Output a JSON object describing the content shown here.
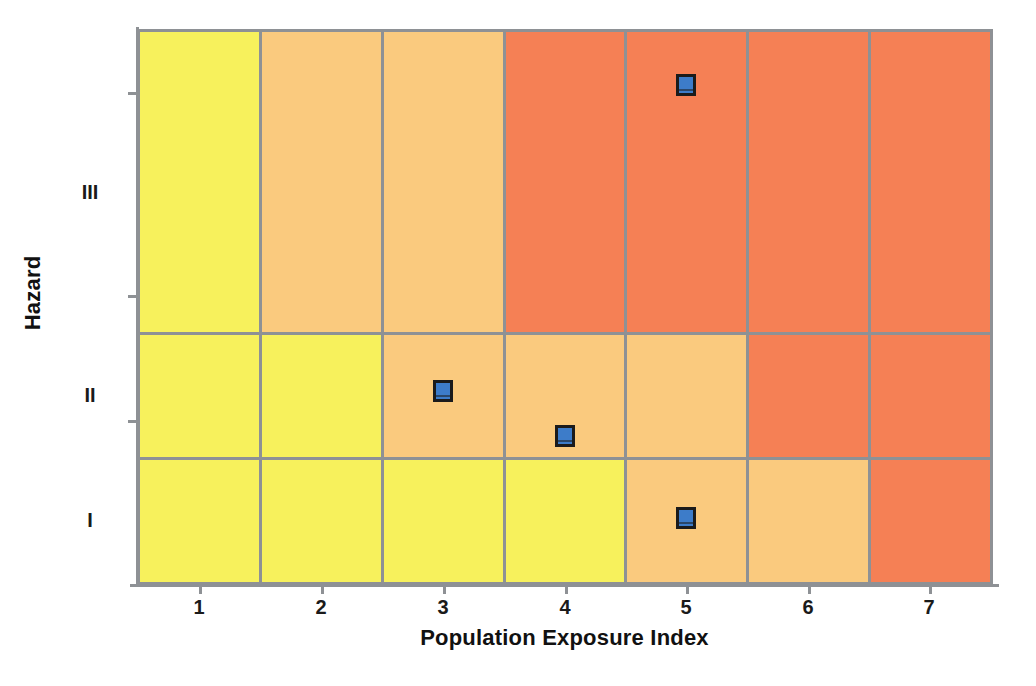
{
  "chart_data": {
    "type": "heatmap",
    "title": "",
    "xlabel": "Population Exposure Index",
    "ylabel": "Hazard",
    "x_tick_labels": [
      "1",
      "2",
      "3",
      "4",
      "5",
      "6",
      "7"
    ],
    "y_tick_labels": [
      "I",
      "II",
      "III"
    ],
    "y_tick_labels_top_down": [
      "III",
      "II",
      "I"
    ],
    "grid": true,
    "legend": "none",
    "xlim": [
      0.5,
      7.5
    ],
    "ylim": [
      0.5,
      3.5
    ],
    "risk_levels": {
      "low": "#F7F15C",
      "medium": "#FACA7E",
      "high": "#F58055"
    },
    "cells": [
      {
        "row": "III",
        "values": [
          "low",
          "medium",
          "medium",
          "high",
          "high",
          "high",
          "high"
        ]
      },
      {
        "row": "II",
        "values": [
          "low",
          "low",
          "medium",
          "medium",
          "medium",
          "high",
          "high"
        ]
      },
      {
        "row": "I",
        "values": [
          "low",
          "low",
          "low",
          "low",
          "medium",
          "medium",
          "high"
        ]
      }
    ],
    "points": [
      {
        "x": 5,
        "y": "III",
        "y_frac": 0.815,
        "label": ""
      },
      {
        "x": 3,
        "y": "II",
        "y_frac": 0.535,
        "label": ""
      },
      {
        "x": 4,
        "y": "II",
        "y_frac": 0.175,
        "label": ""
      },
      {
        "x": 5,
        "y": "I",
        "y_frac": 0.525,
        "label": ""
      }
    ],
    "marker_style": {
      "shape": "square",
      "fill": "#3d7cc9",
      "edge": "#1b1b1b"
    },
    "axis_color": "#8e9195",
    "background": "#ffffff"
  },
  "axes": {
    "x_title": "Population Exposure Index",
    "y_title": "Hazard"
  },
  "x_ticks": [
    {
      "label": "1",
      "px": 199
    },
    {
      "label": "2",
      "px": 321
    },
    {
      "label": "3",
      "px": 443
    },
    {
      "label": "4",
      "px": 565
    },
    {
      "label": "5",
      "px": 686
    },
    {
      "label": "6",
      "px": 808
    },
    {
      "label": "7",
      "px": 929
    }
  ],
  "y_ticks": [
    {
      "label": "III",
      "px": 192
    },
    {
      "label": "II",
      "px": 395
    },
    {
      "label": "I",
      "px": 520
    }
  ]
}
